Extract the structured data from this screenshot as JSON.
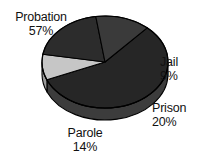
{
  "chart_data": {
    "type": "pie",
    "title": "",
    "subtitle": "",
    "xlabel": "",
    "ylabel": "",
    "legend_position": "none",
    "grid": false,
    "three_d": true,
    "categories": [
      "Probation",
      "Jail",
      "Prison",
      "Parole"
    ],
    "values": [
      57,
      9,
      20,
      14
    ],
    "unit": "%",
    "slices": [
      {
        "label": "Probation",
        "percent": "57%",
        "value": 57,
        "color": "#262626",
        "side_color": "#3c3c3c"
      },
      {
        "label": "Jail",
        "percent": "9%",
        "value": 9,
        "color": "#c6c6c6",
        "side_color": "#9a9a9a"
      },
      {
        "label": "Prison",
        "percent": "20%",
        "value": 20,
        "color": "#2c2c2c",
        "side_color": "#434343"
      },
      {
        "label": "Parole",
        "percent": "14%",
        "value": 14,
        "color": "#3a3a3a",
        "side_color": "#787878"
      }
    ]
  },
  "labels": {
    "probation": {
      "name": "Probation",
      "percent": "57%"
    },
    "jail": {
      "name": "Jail",
      "percent": "9%"
    },
    "prison": {
      "name": "Prison",
      "percent": "20%"
    },
    "parole": {
      "name": "Parole",
      "percent": "14%"
    }
  },
  "colors": {
    "background": "#ffffff",
    "outline": "#000000",
    "text": "#111111"
  }
}
